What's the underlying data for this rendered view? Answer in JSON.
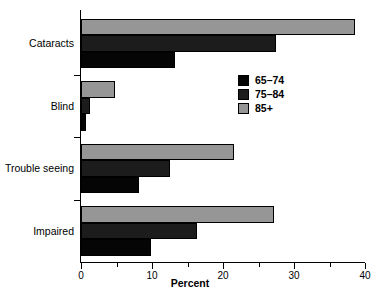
{
  "chart_data": {
    "type": "bar",
    "orientation": "horizontal",
    "title": "",
    "xlabel": "Percent",
    "ylabel": "",
    "xlim": [
      0,
      40
    ],
    "ylim": null,
    "grid": false,
    "legend_position": "upper-right-inside",
    "x_ticks_major": [
      0,
      10,
      20,
      30,
      40
    ],
    "x_tick_labels": [
      "0",
      "10",
      "20",
      "30",
      "40"
    ],
    "x_ticks_minor": [
      5,
      15,
      25,
      35
    ],
    "categories": [
      "Cataracts",
      "Blind",
      "Trouble seeing",
      "Impaired"
    ],
    "series": [
      {
        "name": "65–74",
        "color": "#050505",
        "values": [
          13.2,
          0.7,
          8.2,
          9.9
        ]
      },
      {
        "name": "75–84",
        "color": "#1c1c1c",
        "values": [
          27.5,
          1.3,
          12.5,
          16.3
        ]
      },
      {
        "name": "85+",
        "color": "#969696",
        "values": [
          38.6,
          4.8,
          21.5,
          27.2
        ]
      }
    ]
  },
  "legend": {
    "entries": [
      {
        "label": "65–74",
        "color": "#050505"
      },
      {
        "label": "75–84",
        "color": "#1c1c1c"
      },
      {
        "label": "85+",
        "color": "#969696"
      }
    ]
  },
  "axis": {
    "x_title": "Percent"
  },
  "colors": {
    "axis": "#000000",
    "background": "#ffffff",
    "series_65_74": "#050505",
    "series_75_84": "#1c1c1c",
    "series_85_plus": "#969696"
  }
}
